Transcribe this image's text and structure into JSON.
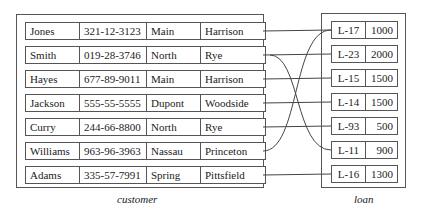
{
  "customer": {
    "caption": "customer",
    "rows": [
      {
        "name": "Jones",
        "ssn": "321-12-3123",
        "street": "Main",
        "city": "Harrison"
      },
      {
        "name": "Smith",
        "ssn": "019-28-3746",
        "street": "North",
        "city": "Rye"
      },
      {
        "name": "Hayes",
        "ssn": "677-89-9011",
        "street": "Main",
        "city": "Harrison"
      },
      {
        "name": "Jackson",
        "ssn": "555-55-5555",
        "street": "Dupont",
        "city": "Woodside"
      },
      {
        "name": "Curry",
        "ssn": "244-66-8800",
        "street": "North",
        "city": "Rye"
      },
      {
        "name": "Williams",
        "ssn": "963-96-3963",
        "street": "Nassau",
        "city": "Princeton"
      },
      {
        "name": "Adams",
        "ssn": "335-57-7991",
        "street": "Spring",
        "city": "Pittsfield"
      }
    ]
  },
  "loan": {
    "caption": "loan",
    "rows": [
      {
        "number": "L-17",
        "amount": "1000"
      },
      {
        "number": "L-23",
        "amount": "2000"
      },
      {
        "number": "L-15",
        "amount": "1500"
      },
      {
        "number": "L-14",
        "amount": "1500"
      },
      {
        "number": "L-93",
        "amount": "500"
      },
      {
        "number": "L-11",
        "amount": "900"
      },
      {
        "number": "L-16",
        "amount": "1300"
      }
    ]
  },
  "links": [
    {
      "customer": "Jones",
      "loan": "L-17"
    },
    {
      "customer": "Smith",
      "loan": "L-23"
    },
    {
      "customer": "Smith",
      "loan": "L-11"
    },
    {
      "customer": "Hayes",
      "loan": "L-15"
    },
    {
      "customer": "Jackson",
      "loan": "L-14"
    },
    {
      "customer": "Curry",
      "loan": "L-93"
    },
    {
      "customer": "Williams",
      "loan": "L-17"
    },
    {
      "customer": "Adams",
      "loan": "L-16"
    }
  ]
}
